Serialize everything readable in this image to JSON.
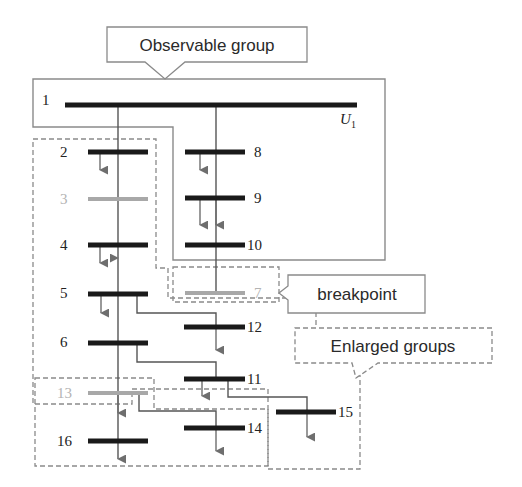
{
  "diagram": {
    "callouts": {
      "observable": "Observable group",
      "breakpoint": "breakpoint",
      "enlarged": "Enlarged groups"
    },
    "bus_labels": {
      "b1": "1",
      "b2": "2",
      "b3": "3",
      "b4": "4",
      "b5": "5",
      "b6": "6",
      "b7": "7",
      "b8": "8",
      "b9": "9",
      "b10": "10",
      "b11": "11",
      "b12": "12",
      "b13": "13",
      "b14": "14",
      "b15": "15",
      "b16": "16"
    },
    "source_label": {
      "main": "U",
      "sub": "1"
    },
    "colors": {
      "bus_active": "#1a1a1a",
      "bus_inactive": "#a8a8a8",
      "line": "#555555",
      "load_arrow": "#6e6e6e",
      "group_outline": "#8a8a8a",
      "inactive_label": "#b3b3b3"
    }
  }
}
